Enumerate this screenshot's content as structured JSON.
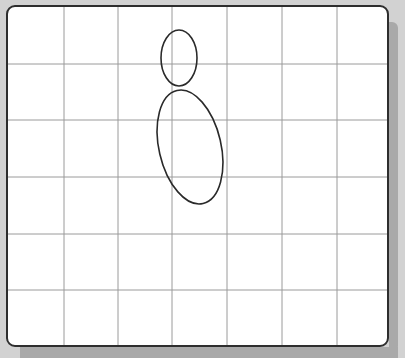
{
  "board": {
    "background": "#ffffff",
    "border_color": "#2e2e2e",
    "grid_color": "#9a9a9a",
    "stroke_color": "#2a2a2a",
    "columns": 7,
    "rows": 6,
    "grid": {
      "vertical_x": [
        62,
        116,
        170,
        225,
        280,
        335
      ],
      "horizontal_y": [
        62,
        118,
        175,
        232,
        288
      ]
    }
  },
  "shapes": [
    {
      "name": "small-ellipse",
      "cx": 177,
      "cy": 56,
      "rx": 18,
      "ry": 28,
      "rotation": 0
    },
    {
      "name": "large-ellipse",
      "cx": 188,
      "cy": 145,
      "rx": 31,
      "ry": 58,
      "rotation": -13
    }
  ]
}
